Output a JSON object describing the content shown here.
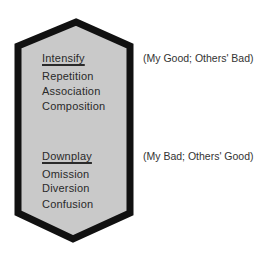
{
  "diagram": {
    "shape": {
      "fill": "#c9c9c9",
      "stroke": "#111111"
    },
    "intensify": {
      "heading": "Intensify",
      "items": [
        "Repetition",
        "Association",
        "Composition"
      ],
      "note": "(My Good; Others' Bad)"
    },
    "downplay": {
      "heading": "Downplay",
      "items": [
        "Omission",
        "Diversion",
        "Confusion"
      ],
      "note": "(My Bad; Others' Good)"
    }
  }
}
